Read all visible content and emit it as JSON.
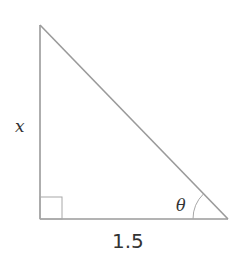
{
  "diagram": {
    "type": "right-triangle",
    "labels": {
      "vertical_side": "x",
      "base_side": "1.5",
      "angle": "θ"
    },
    "right_angle_marker": true,
    "angle_position": "bottom-right",
    "colors": {
      "line": "#9a9a9a",
      "marker": "#a8a8a8",
      "text": "#333333",
      "background": "#ffffff"
    }
  }
}
